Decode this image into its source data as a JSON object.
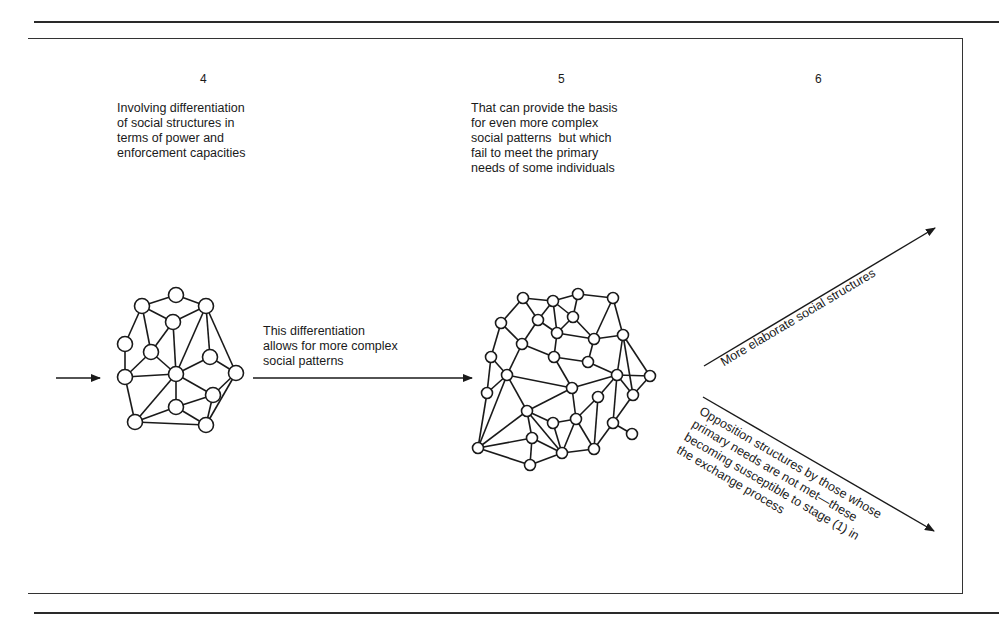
{
  "stages": [
    {
      "number": "4",
      "description": "Involving differentiation\nof social structures in\nterms of power and\nenforcement capacities"
    },
    {
      "number": "5",
      "description": "That can provide the basis\nfor even more complex\nsocial patterns  but which\nfail to meet the primary\nneeds of some individuals"
    },
    {
      "number": "6"
    }
  ],
  "transition_label": "This differentiation\nallows for more complex\nsocial patterns",
  "branch_up_label": "More elaborate social structures",
  "branch_down_label": "Opposition structures by those whose\nprimary needs are not met—these\nbecoming susceptible to stage (1) in\nthe exchange process",
  "networks": {
    "left": {
      "nodes": [
        [
          176,
          295
        ],
        [
          142,
          306
        ],
        [
          206,
          306
        ],
        [
          173,
          322
        ],
        [
          125,
          344
        ],
        [
          151,
          352
        ],
        [
          210,
          357
        ],
        [
          125,
          377
        ],
        [
          176,
          374
        ],
        [
          236,
          373
        ],
        [
          213,
          395
        ],
        [
          176,
          407
        ],
        [
          135,
          422
        ],
        [
          206,
          425
        ]
      ],
      "edges": [
        [
          0,
          1
        ],
        [
          0,
          2
        ],
        [
          1,
          3
        ],
        [
          2,
          3
        ],
        [
          1,
          5
        ],
        [
          1,
          4
        ],
        [
          2,
          8
        ],
        [
          2,
          6
        ],
        [
          2,
          9
        ],
        [
          3,
          5
        ],
        [
          3,
          8
        ],
        [
          4,
          7
        ],
        [
          5,
          7
        ],
        [
          5,
          8
        ],
        [
          7,
          8
        ],
        [
          7,
          12
        ],
        [
          6,
          8
        ],
        [
          6,
          9
        ],
        [
          8,
          10
        ],
        [
          8,
          11
        ],
        [
          8,
          12
        ],
        [
          9,
          10
        ],
        [
          9,
          13
        ],
        [
          10,
          11
        ],
        [
          10,
          13
        ],
        [
          11,
          12
        ],
        [
          11,
          13
        ],
        [
          12,
          13
        ]
      ]
    },
    "right": {
      "nodes": [
        [
          523,
          298
        ],
        [
          553,
          301
        ],
        [
          578,
          294
        ],
        [
          613,
          298
        ],
        [
          501,
          323
        ],
        [
          538,
          320
        ],
        [
          573,
          317
        ],
        [
          557,
          333
        ],
        [
          623,
          335
        ],
        [
          594,
          339
        ],
        [
          522,
          344
        ],
        [
          491,
          357
        ],
        [
          554,
          357
        ],
        [
          588,
          362
        ],
        [
          507,
          375
        ],
        [
          617,
          375
        ],
        [
          650,
          376
        ],
        [
          572,
          388
        ],
        [
          487,
          393
        ],
        [
          633,
          395
        ],
        [
          598,
          397
        ],
        [
          527,
          411
        ],
        [
          576,
          419
        ],
        [
          553,
          423
        ],
        [
          613,
          423
        ],
        [
          532,
          438
        ],
        [
          632,
          434
        ],
        [
          478,
          448
        ],
        [
          562,
          453
        ],
        [
          594,
          449
        ],
        [
          530,
          465
        ]
      ],
      "edges": [
        [
          0,
          1
        ],
        [
          1,
          2
        ],
        [
          2,
          3
        ],
        [
          0,
          4
        ],
        [
          0,
          5
        ],
        [
          1,
          5
        ],
        [
          1,
          6
        ],
        [
          1,
          7
        ],
        [
          2,
          6
        ],
        [
          3,
          8
        ],
        [
          3,
          9
        ],
        [
          5,
          7
        ],
        [
          6,
          7
        ],
        [
          6,
          9
        ],
        [
          5,
          10
        ],
        [
          4,
          10
        ],
        [
          4,
          11
        ],
        [
          7,
          9
        ],
        [
          7,
          12
        ],
        [
          9,
          8
        ],
        [
          9,
          13
        ],
        [
          10,
          12
        ],
        [
          10,
          14
        ],
        [
          11,
          14
        ],
        [
          11,
          18
        ],
        [
          12,
          13
        ],
        [
          12,
          17
        ],
        [
          13,
          15
        ],
        [
          14,
          17
        ],
        [
          15,
          17
        ],
        [
          8,
          15
        ],
        [
          8,
          16
        ],
        [
          8,
          19
        ],
        [
          15,
          16
        ],
        [
          15,
          19
        ],
        [
          16,
          19
        ],
        [
          14,
          18
        ],
        [
          14,
          21
        ],
        [
          14,
          27
        ],
        [
          18,
          27
        ],
        [
          17,
          21
        ],
        [
          17,
          22
        ],
        [
          15,
          20
        ],
        [
          15,
          24
        ],
        [
          19,
          24
        ],
        [
          20,
          22
        ],
        [
          20,
          29
        ],
        [
          21,
          25
        ],
        [
          21,
          27
        ],
        [
          21,
          23
        ],
        [
          21,
          28
        ],
        [
          22,
          23
        ],
        [
          22,
          28
        ],
        [
          23,
          28
        ],
        [
          22,
          29
        ],
        [
          24,
          26
        ],
        [
          24,
          29
        ],
        [
          25,
          27
        ],
        [
          25,
          28
        ],
        [
          25,
          30
        ],
        [
          27,
          30
        ],
        [
          28,
          30
        ],
        [
          28,
          29
        ]
      ]
    }
  }
}
